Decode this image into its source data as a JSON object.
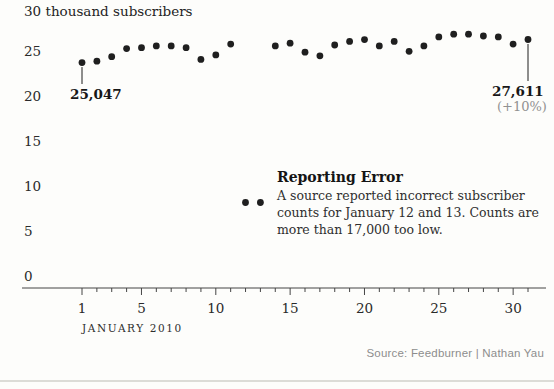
{
  "header": {
    "title": "30 thousand subscribers"
  },
  "x_axis": {
    "title": "JANUARY 2010",
    "labeled_ticks": [
      1,
      5,
      10,
      15,
      20,
      25,
      30
    ]
  },
  "y_axis": {
    "max_label": "30",
    "unit_label": "thousand subscribers",
    "labeled_ticks": [
      25,
      20,
      15,
      10,
      5,
      0
    ]
  },
  "annotations": {
    "start_point": {
      "label": "25,047"
    },
    "end_point": {
      "label": "27,611",
      "sublabel": "(+10%)"
    },
    "reporting_error": {
      "title": "Reporting Error",
      "lines": [
        "A source reported incorrect subscriber",
        "counts for January 12 and 13. Counts are",
        "more than 17,000 too low."
      ]
    }
  },
  "source": "Source: Feedburner | Nathan Yau",
  "colors": {
    "background": "#fdfdfb",
    "ink": "#1e1e1e",
    "dot": "#1f1f1f",
    "axis": "#454545",
    "muted": "#919191",
    "source_text": "#8d8d8d",
    "bottom_rule": "#dcdcd7"
  },
  "chart_data": {
    "type": "scatter",
    "title": "30 thousand subscribers",
    "xlabel": "JANUARY 2010",
    "units": "thousand subscribers",
    "x": [
      1,
      2,
      3,
      4,
      5,
      6,
      7,
      8,
      9,
      10,
      11,
      12,
      13,
      14,
      15,
      16,
      17,
      18,
      19,
      20,
      21,
      22,
      23,
      24,
      25,
      26,
      27,
      28,
      29,
      30,
      31
    ],
    "values": [
      25.047,
      25.2,
      25.7,
      26.6,
      26.7,
      26.9,
      26.9,
      26.7,
      25.4,
      25.9,
      27.1,
      9.5,
      9.5,
      26.9,
      27.2,
      26.2,
      25.8,
      27.0,
      27.4,
      27.6,
      26.9,
      27.4,
      26.3,
      26.9,
      27.9,
      28.2,
      28.2,
      28.0,
      27.9,
      27.1,
      27.611
    ],
    "xlim": [
      1,
      31
    ],
    "ylim": [
      0,
      30
    ],
    "x_ticks_labeled": [
      1,
      5,
      10,
      15,
      20,
      25,
      30
    ],
    "y_ticks": [
      0,
      5,
      10,
      15,
      20,
      25,
      30
    ],
    "grid": false,
    "legend": "none",
    "annotated_points": [
      {
        "x": 1,
        "value_label": "25,047"
      },
      {
        "x": 31,
        "value_label": "27,611",
        "change_label": "(+10%)"
      }
    ],
    "error_days": [
      12,
      13
    ],
    "error_note": "A source reported incorrect subscriber counts for January 12 and 13. Counts are more than 17,000 too low."
  }
}
